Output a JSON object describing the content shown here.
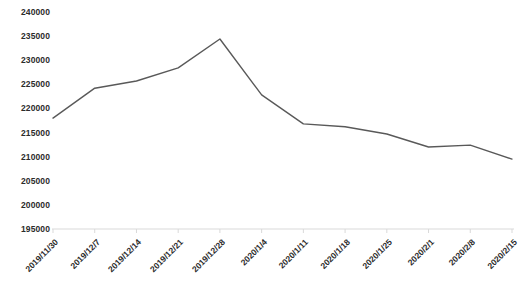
{
  "chart_data": {
    "type": "line",
    "title": "",
    "subtitle": "",
    "xlabel": "",
    "ylabel": "",
    "grid": false,
    "legend": false,
    "legend_position": "none",
    "line_color": "#595959",
    "background_color": "#ffffff",
    "axis_color": "#d9d9d9",
    "tick_label_color": "#2b2b2b",
    "categories": [
      "2019/11/30",
      "2019/12/7",
      "2019/12/14",
      "2019/12/21",
      "2019/12/28",
      "2020/1/4",
      "2020/1/11",
      "2020/1/18",
      "2020/1/25",
      "2020/2/1",
      "2020/2/8",
      "2020/2/15"
    ],
    "values": [
      218000,
      224200,
      225700,
      228400,
      234400,
      222800,
      216800,
      216200,
      214700,
      212000,
      212400,
      209500
    ],
    "ylim": [
      195000,
      240000
    ],
    "ytick_step": 5000,
    "ytick_labels": [
      "240000",
      "235000",
      "230000",
      "225000",
      "220000",
      "215000",
      "210000",
      "205000",
      "200000",
      "195000"
    ],
    "ytick_values": [
      240000,
      235000,
      230000,
      225000,
      220000,
      215000,
      210000,
      205000,
      200000,
      195000
    ]
  }
}
